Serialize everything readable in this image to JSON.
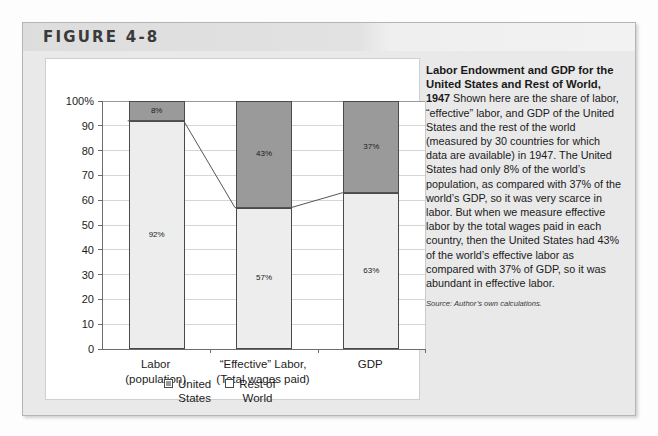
{
  "figure": {
    "label": "FIGURE 4-8"
  },
  "caption": {
    "title": "Labor Endowment and GDP for the United States and Rest of World,",
    "lead": "1947",
    "body": "Shown here are the share of labor, “effective” labor, and GDP of the United States and the rest of the world (measured by 30 countries for which data are available) in 1947. The United States had only 8% of the world’s population, as compared with 37% of the world’s GDP, so it was very scarce in labor. But when we measure effective labor by the total wages paid in each country, then the United States had 43% of the world’s effective labor as compared with 37% of GDP, so it was abundant in effective labor.",
    "source": "Source: Author’s own calculations."
  },
  "chart_data": {
    "type": "bar",
    "stacked": true,
    "title": "",
    "xlabel": "",
    "ylabel": "",
    "ylim": [
      0,
      100
    ],
    "yticks": [
      0,
      10,
      20,
      30,
      40,
      50,
      60,
      70,
      80,
      90,
      100
    ],
    "ytick_labels": [
      "0",
      "10",
      "20",
      "30",
      "40",
      "50",
      "60",
      "70",
      "80",
      "90",
      "100%"
    ],
    "grid": true,
    "legend_position": "bottom-center",
    "categories": [
      {
        "line1": "Labor",
        "line2": "(population)"
      },
      {
        "line1": "“Effective” Labor,",
        "line2": "(Total wages paid)"
      },
      {
        "line1": "GDP",
        "line2": ""
      }
    ],
    "series": [
      {
        "name": "United States",
        "legend_label": "United\nStates",
        "color": "#9a9a9a",
        "values": [
          8,
          43,
          37
        ],
        "value_labels": [
          "8%",
          "43%",
          "37%"
        ]
      },
      {
        "name": "Rest of World",
        "legend_label": "Rest of\nWorld",
        "color": "#ededed",
        "values": [
          92,
          57,
          63
        ],
        "value_labels": [
          "92%",
          "57%",
          "63%"
        ]
      }
    ],
    "connector_line": {
      "description": "line connecting tops of Rest of World segments",
      "values": [
        92,
        57,
        63
      ],
      "color": "#555555"
    }
  }
}
